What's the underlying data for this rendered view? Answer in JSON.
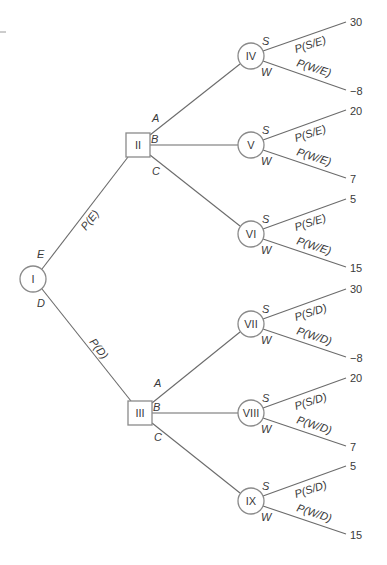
{
  "diagram": {
    "type": "decision-tree",
    "colors": {
      "line": "#6b6b6b",
      "node_stroke": "#8a8a8a",
      "text": "#3a3a3a",
      "background": "#ffffff"
    },
    "root": {
      "id": "I",
      "shape": "circle",
      "branches": [
        {
          "event": "E",
          "probability": "P(E)",
          "node": {
            "id": "II",
            "shape": "square",
            "decisions": [
              {
                "label": "A",
                "node": {
                  "id": "IV",
                  "shape": "circle",
                  "outcomes": [
                    {
                      "label": "S",
                      "probability": "P(S/E)",
                      "payoff": "30"
                    },
                    {
                      "label": "W",
                      "probability": "P(W/E)",
                      "payoff": "−8"
                    }
                  ]
                }
              },
              {
                "label": "B",
                "node": {
                  "id": "V",
                  "shape": "circle",
                  "outcomes": [
                    {
                      "label": "S",
                      "probability": "P(S/E)",
                      "payoff": "20"
                    },
                    {
                      "label": "W",
                      "probability": "P(W/E)",
                      "payoff": "7"
                    }
                  ]
                }
              },
              {
                "label": "C",
                "node": {
                  "id": "VI",
                  "shape": "circle",
                  "outcomes": [
                    {
                      "label": "S",
                      "probability": "P(S/E)",
                      "payoff": "5"
                    },
                    {
                      "label": "W",
                      "probability": "P(W/E)",
                      "payoff": "15"
                    }
                  ]
                }
              }
            ]
          }
        },
        {
          "event": "D",
          "probability": "P(D)",
          "node": {
            "id": "III",
            "shape": "square",
            "decisions": [
              {
                "label": "A",
                "node": {
                  "id": "VII",
                  "shape": "circle",
                  "outcomes": [
                    {
                      "label": "S",
                      "probability": "P(S/D)",
                      "payoff": "30"
                    },
                    {
                      "label": "W",
                      "probability": "P(W/D)",
                      "payoff": "−8"
                    }
                  ]
                }
              },
              {
                "label": "B",
                "node": {
                  "id": "VIII",
                  "shape": "circle",
                  "outcomes": [
                    {
                      "label": "S",
                      "probability": "P(S/D)",
                      "payoff": "20"
                    },
                    {
                      "label": "W",
                      "probability": "P(W/D)",
                      "payoff": "7"
                    }
                  ]
                }
              },
              {
                "label": "C",
                "node": {
                  "id": "IX",
                  "shape": "circle",
                  "outcomes": [
                    {
                      "label": "S",
                      "probability": "P(S/D)",
                      "payoff": "5"
                    },
                    {
                      "label": "W",
                      "probability": "P(W/D)",
                      "payoff": "15"
                    }
                  ]
                }
              }
            ]
          }
        }
      ]
    }
  }
}
